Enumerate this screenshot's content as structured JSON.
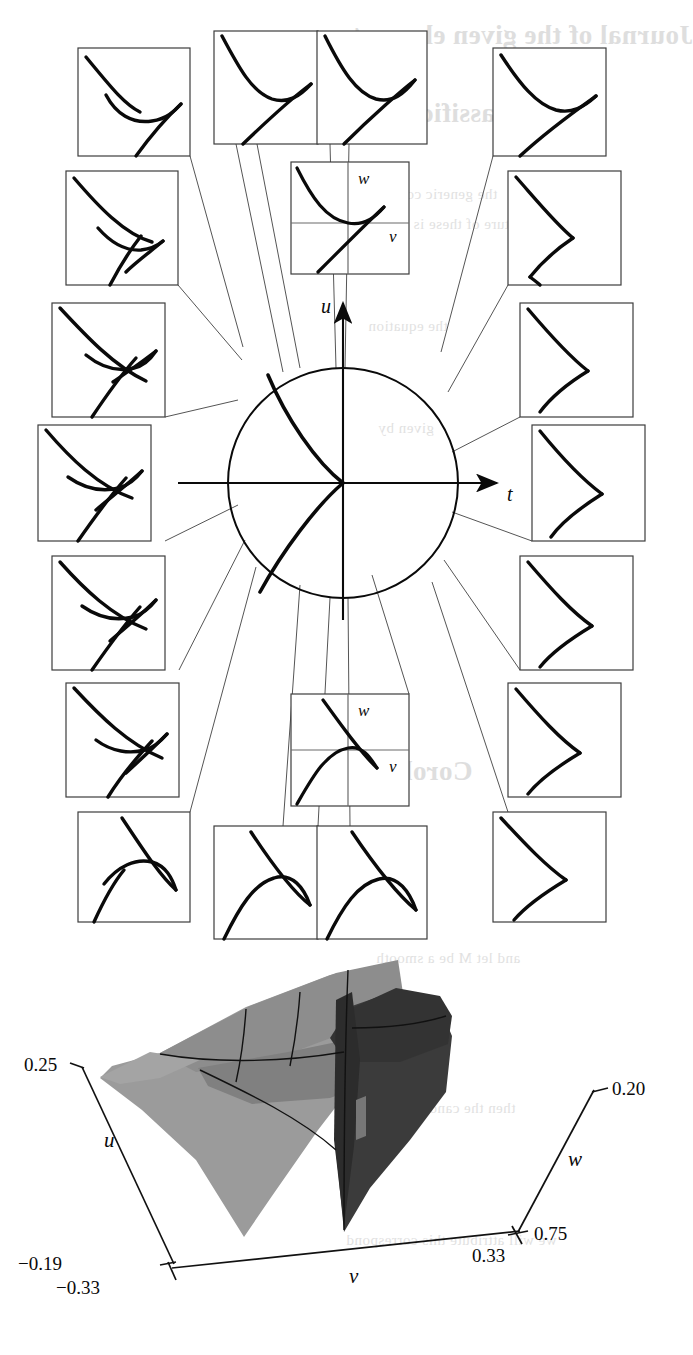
{
  "figure": {
    "kind": "mathematical-figure",
    "ink_color": "#0a0a0a",
    "thin_line_color": "#4a4a4a",
    "box_border_color": "#3d3d3d"
  },
  "top_panel": {
    "name": "bifurcation-diagram",
    "axes": {
      "horizontal_label": "t",
      "vertical_label": "u"
    },
    "center_circle": {
      "cx": 343,
      "cy": 483,
      "r": 115
    },
    "insets": [
      {
        "id": "inset-nw-1",
        "label": "",
        "x": 78,
        "y": 48,
        "w": 112,
        "h": 108,
        "type": "cusp-upper-left-arrow"
      },
      {
        "id": "inset-n-1",
        "label": "",
        "x": 214,
        "y": 31,
        "w": 104,
        "h": 113,
        "type": "parabola-line-touch"
      },
      {
        "id": "inset-n-2",
        "label": "",
        "x": 317,
        "y": 31,
        "w": 110,
        "h": 113,
        "type": "parabola-line-cross"
      },
      {
        "id": "inset-ne-1",
        "label": "",
        "x": 493,
        "y": 48,
        "w": 113,
        "h": 108,
        "type": "cusp-right"
      },
      {
        "id": "inset-w-1",
        "label": "",
        "x": 66,
        "y": 171,
        "w": 112,
        "h": 114,
        "type": "swallowtail-small"
      },
      {
        "id": "inset-w-2",
        "label": "",
        "x": 52,
        "y": 303,
        "w": 113,
        "h": 114,
        "type": "swallowtail-open"
      },
      {
        "id": "inset-w-3",
        "label": "",
        "x": 38,
        "y": 425,
        "w": 113,
        "h": 116,
        "type": "swallowtail-crossed"
      },
      {
        "id": "inset-w-4",
        "label": "",
        "x": 52,
        "y": 556,
        "w": 113,
        "h": 114,
        "type": "swallowtail-crossed-2"
      },
      {
        "id": "inset-w-5",
        "label": "",
        "x": 66,
        "y": 683,
        "w": 113,
        "h": 114,
        "type": "swallowtail-tail"
      },
      {
        "id": "inset-sw-1",
        "label": "",
        "x": 78,
        "y": 812,
        "w": 112,
        "h": 110,
        "type": "cusp-lower-left-arrow"
      },
      {
        "id": "inset-s-1",
        "label": "",
        "x": 214,
        "y": 826,
        "w": 104,
        "h": 113,
        "type": "hump-line-touch"
      },
      {
        "id": "inset-s-2",
        "label": "",
        "x": 317,
        "y": 826,
        "w": 110,
        "h": 113,
        "type": "hump-line-cross"
      },
      {
        "id": "inset-e-1",
        "label": "",
        "x": 508,
        "y": 171,
        "w": 113,
        "h": 114,
        "type": "cusp-right-2"
      },
      {
        "id": "inset-e-2",
        "label": "",
        "x": 520,
        "y": 303,
        "w": 113,
        "h": 114,
        "type": "cusp-right-3"
      },
      {
        "id": "inset-e-3",
        "label": "",
        "x": 532,
        "y": 425,
        "w": 113,
        "h": 116,
        "type": "cusp-right-4"
      },
      {
        "id": "inset-e-4",
        "label": "",
        "x": 520,
        "y": 556,
        "w": 113,
        "h": 114,
        "type": "cusp-right-5"
      },
      {
        "id": "inset-e-5",
        "label": "",
        "x": 508,
        "y": 683,
        "w": 113,
        "h": 114,
        "type": "cusp-right-6"
      },
      {
        "id": "inset-se-1",
        "label": "",
        "x": 493,
        "y": 812,
        "w": 113,
        "h": 110,
        "type": "cusp-right-7"
      }
    ],
    "labeled_insets": [
      {
        "id": "inset-top-center",
        "x": 291,
        "y": 162,
        "w": 118,
        "h": 112,
        "axis_x_label": "v",
        "axis_y_label": "w",
        "type": "parabola-up-with-line"
      },
      {
        "id": "inset-bottom-center",
        "x": 291,
        "y": 694,
        "w": 118,
        "h": 112,
        "axis_x_label": "v",
        "axis_y_label": "w",
        "type": "parabola-down-with-line"
      }
    ]
  },
  "bottom_panel": {
    "name": "swallowtail-surface-3d",
    "surface_colors": {
      "light_sheet": "#979797",
      "mid_sheet": "#7e7e7e",
      "dark_sheet": "#3b3b3b",
      "darker_sheet": "#2b2b2b"
    },
    "axes": [
      {
        "name": "u",
        "label": "u",
        "max_tick": "0.25",
        "min_tick": "-0.19"
      },
      {
        "name": "v",
        "label": "v",
        "min_tick": "-0.33",
        "max_tick": "0.33"
      },
      {
        "name": "w",
        "label": "w",
        "max_tick": "0.20",
        "min_tick": "0.75"
      }
    ],
    "tick_labels": {
      "u_top": "0.25",
      "u_bottom": "-0.19",
      "v_left": "-0.33",
      "v_right": "0.33",
      "w_top": "0.20",
      "w_bottom": "0.75"
    },
    "axis_labels": {
      "u": "u",
      "v": "v",
      "w": "w"
    }
  },
  "chart_data": {
    "type": "line",
    "title": "",
    "xlabel": "t",
    "ylabel": "u",
    "series": [
      {
        "name": "swallowtail-bifurcation-curve",
        "description": "Cusp-shaped discriminant curve inside the unit circle, cusp point at the origin opening to the left"
      }
    ],
    "annotations": [
      "18 surrounding inset boxes showing local curve configurations around the circle",
      "2 labeled insets (v, w) at top-center and bottom-center"
    ]
  },
  "bleed_through": {
    "note": "Faint mirrored show-through text from the reverse side of the printed page",
    "lines": [
      {
        "text": "Journal of the given element",
        "x": 352,
        "y": 20,
        "cls": "big"
      },
      {
        "text": "classification",
        "x": 360,
        "y": 98,
        "cls": "big"
      },
      {
        "text": "the generic condition",
        "x": 360,
        "y": 186,
        "cls": "mid"
      },
      {
        "text": "structure of these is denoted",
        "x": 358,
        "y": 216,
        "cls": "mid"
      },
      {
        "text": "the equation",
        "x": 368,
        "y": 318,
        "cls": "mid"
      },
      {
        "text": "given by",
        "x": 378,
        "y": 420,
        "cls": "mid"
      },
      {
        "text": "Corollary",
        "x": 356,
        "y": 756,
        "cls": "big"
      },
      {
        "text": "and let M be a smooth",
        "x": 376,
        "y": 950,
        "cls": "mid"
      },
      {
        "text": "then the canonical form",
        "x": 362,
        "y": 1100,
        "cls": "mid"
      },
      {
        "text": "we will attribute this correspond",
        "x": 346,
        "y": 1232,
        "cls": "mid"
      }
    ]
  }
}
